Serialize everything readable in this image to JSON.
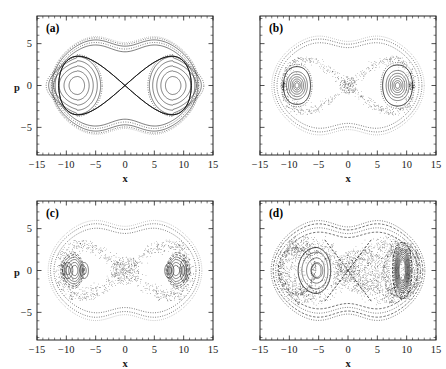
{
  "figure": {
    "panel_count": 4,
    "layout": "2x2 grid",
    "background_color": "#ffffff",
    "line_color": "#111111"
  },
  "axes": {
    "xlabel": "x",
    "ylabel": "p",
    "x_ticks": [
      "-15",
      "-10",
      "-5",
      "0",
      "5",
      "10",
      "15"
    ],
    "y_ticks": [
      "5",
      "0",
      "-5"
    ],
    "x_tick_values": [
      -15,
      -10,
      -5,
      0,
      5,
      10,
      15
    ],
    "y_tick_values": [
      5,
      0,
      -5
    ],
    "xlim": [
      -15,
      15
    ],
    "ylim": [
      -8.3,
      8.3
    ],
    "minor_tick_step": 1,
    "grid": false
  },
  "panels": [
    {
      "tag": "(a)",
      "name": "panel-a",
      "description": "Regular integrable phase portrait: two symmetric elliptic islands about x = -8 and x = +8 separated by a hyperbolic X-point at the origin, with smooth nested KAM tori and a figure-eight separatrix.",
      "regime": "integrable / unperturbed",
      "fixed_points": {
        "elliptic": [
          [
            -8,
            0
          ],
          [
            8,
            0
          ]
        ],
        "hyperbolic": [
          [
            0,
            0
          ]
        ]
      },
      "chaos_level": 0.0
    },
    {
      "tag": "(b)",
      "name": "panel-b",
      "description": "Weak perturbation: nested tori remain but the separatrix has broken into a thin stochastic layer; small secondary islands appear around each elliptic centre.",
      "regime": "weakly perturbed",
      "fixed_points": {
        "elliptic": [
          [
            -8,
            0
          ],
          [
            8,
            0
          ]
        ],
        "hyperbolic": [
          [
            0,
            0
          ]
        ]
      },
      "chaos_level": 0.25
    },
    {
      "tag": "(c)",
      "name": "panel-c",
      "description": "Moderate perturbation: broadened stochastic separatrix layer, distorted crescent-shaped inner tori and visible period-2 secondary island chains inside each well.",
      "regime": "moderately perturbed",
      "fixed_points": {
        "elliptic": [
          [
            -9.6,
            0
          ],
          [
            7.6,
            0
          ]
        ],
        "hyperbolic": [
          [
            0,
            0
          ]
        ]
      },
      "chaos_level": 0.5
    },
    {
      "tag": "(d)",
      "name": "panel-d",
      "description": "Strong perturbation: a large connected chaotic sea fills the region around the X-point and the right well; only a small regular island survives in the left well and a tightly wound regular region near x = +9.",
      "regime": "strongly perturbed / largely chaotic",
      "fixed_points": {
        "elliptic": [
          [
            -5.2,
            0
          ],
          [
            9.2,
            0
          ]
        ],
        "hyperbolic": [
          [
            0,
            0
          ]
        ]
      },
      "chaos_level": 0.85
    }
  ],
  "chart_data": {
    "type": "scatter",
    "xlabel": "x",
    "ylabel": "p",
    "xlim": [
      -15,
      15
    ],
    "ylim": [
      -8.3,
      8.3
    ],
    "grid": false,
    "legend": "none",
    "subplots": [
      {
        "tag": "(a)",
        "xlabel": "x",
        "ylabel": "p",
        "xlim": [
          -15,
          15
        ],
        "ylim": [
          -8.3,
          8.3
        ],
        "series": [
          {
            "name": "left-island-tori",
            "kind": "closed-contours",
            "center": [
              -8.2,
              0
            ],
            "semi_axes_x": [
              1.6,
              2.5,
              3.4,
              4.2
            ],
            "semi_axes_y": [
              1.4,
              2.2,
              2.9,
              3.5
            ],
            "style": "solid"
          },
          {
            "name": "right-island-tori",
            "kind": "closed-contours",
            "center": [
              8.2,
              0
            ],
            "semi_axes_x": [
              1.6,
              2.5,
              3.4,
              4.2
            ],
            "semi_axes_y": [
              1.4,
              2.2,
              2.9,
              3.5
            ],
            "style": "solid"
          },
          {
            "name": "separatrix-figure-eight",
            "kind": "separatrix",
            "x_extent": [
              -11.6,
              11.6
            ],
            "p_extent": [
              -5.4,
              5.4
            ],
            "saddle": [
              0,
              0
            ],
            "style": "solid"
          },
          {
            "name": "outer-circulating-tori",
            "kind": "closed-contours",
            "count": 5,
            "p_max": [
              5.7,
              6.0,
              6.3,
              6.5,
              6.7
            ],
            "x_max": [
              11.9,
              12.1,
              12.3,
              12.5,
              12.6
            ],
            "style": "solid-and-dotted"
          }
        ]
      },
      {
        "tag": "(b)",
        "xlabel": "x",
        "ylabel": "p",
        "xlim": [
          -15,
          15
        ],
        "ylim": [
          -8.3,
          8.3
        ],
        "series": [
          {
            "name": "left-island-tori",
            "kind": "closed-contours",
            "center": [
              -8.6,
              0
            ],
            "semi_axes_x": [
              0.5,
              1.0,
              1.6,
              2.3,
              3.0
            ],
            "semi_axes_y": [
              0.45,
              0.9,
              1.4,
              2.0,
              2.6
            ],
            "style": "solid"
          },
          {
            "name": "right-island-tori",
            "kind": "closed-contours",
            "center": [
              8.4,
              0
            ],
            "semi_axes_x": [
              0.6,
              1.2,
              1.9,
              2.7,
              3.4
            ],
            "semi_axes_y": [
              0.5,
              1.1,
              1.7,
              2.4,
              3.0
            ],
            "style": "solid"
          },
          {
            "name": "stochastic-separatrix-layer",
            "kind": "scatter-cloud",
            "n_points": 900,
            "x_extent": [
              -11.5,
              11.5
            ],
            "p_extent": [
              -4.6,
              4.6
            ],
            "style": "dotted"
          },
          {
            "name": "outer-invariant-curves",
            "kind": "closed-contours",
            "count": 3,
            "p_max": [
              5.6,
              6.2,
              6.6
            ],
            "x_max": [
              12.0,
              12.6,
              13.0
            ],
            "style": "dotted"
          }
        ]
      },
      {
        "tag": "(c)",
        "xlabel": "x",
        "ylabel": "p",
        "xlim": [
          -15,
          15
        ],
        "ylim": [
          -8.3,
          8.3
        ],
        "series": [
          {
            "name": "left-core-island",
            "kind": "closed-contours",
            "center": [
              -9.7,
              0
            ],
            "semi_axes_x": [
              0.45,
              0.85
            ],
            "semi_axes_y": [
              0.5,
              0.95
            ],
            "style": "solid"
          },
          {
            "name": "left-secondary-island",
            "kind": "closed-contours",
            "center": [
              -7.0,
              0
            ],
            "semi_axes_x": [
              0.7
            ],
            "semi_axes_y": [
              0.9
            ],
            "style": "solid"
          },
          {
            "name": "left-crescent-tori",
            "kind": "closed-contours",
            "center": [
              -8.4,
              0
            ],
            "count": 4,
            "style": "solid"
          },
          {
            "name": "right-core-island",
            "kind": "closed-contours",
            "center": [
              7.6,
              0
            ],
            "semi_axes_x": [
              0.35,
              0.7
            ],
            "semi_axes_y": [
              0.4,
              0.8
            ],
            "style": "solid"
          },
          {
            "name": "right-secondary-island",
            "kind": "closed-contours",
            "center": [
              9.9,
              0
            ],
            "semi_axes_x": [
              0.55
            ],
            "semi_axes_y": [
              1.2
            ],
            "style": "solid"
          },
          {
            "name": "right-crescent-tori",
            "kind": "closed-contours",
            "center": [
              8.6,
              0
            ],
            "count": 4,
            "style": "solid"
          },
          {
            "name": "broad-stochastic-layer",
            "kind": "scatter-cloud",
            "n_points": 1200,
            "x_extent": [
              -11.8,
              11.8
            ],
            "p_extent": [
              -4.4,
              4.4
            ],
            "style": "dashed-dotted"
          },
          {
            "name": "outer-invariant-curves",
            "kind": "closed-contours",
            "count": 3,
            "p_max": [
              5.5,
              6.3,
              6.8
            ],
            "x_max": [
              12.0,
              12.7,
              13.1
            ],
            "style": "dotted"
          }
        ]
      },
      {
        "tag": "(d)",
        "xlabel": "x",
        "ylabel": "p",
        "xlim": [
          -15,
          15
        ],
        "ylim": [
          -8.3,
          8.3
        ],
        "series": [
          {
            "name": "left-regular-island",
            "kind": "closed-contours",
            "center": [
              -5.3,
              0
            ],
            "semi_axes_x": [
              0.9,
              1.9,
              3.0
            ],
            "semi_axes_y": [
              0.85,
              1.7,
              2.6
            ],
            "style": "solid"
          },
          {
            "name": "right-regular-island",
            "kind": "closed-contours",
            "center": [
              9.3,
              0
            ],
            "semi_axes_x": [
              0.4,
              0.8,
              1.2,
              1.6
            ],
            "semi_axes_y": [
              1.0,
              1.8,
              2.4,
              2.9
            ],
            "style": "solid"
          },
          {
            "name": "chaotic-sea",
            "kind": "scatter-cloud",
            "n_points": 2600,
            "x_extent": [
              -11.8,
              12.2
            ],
            "p_extent": [
              -4.5,
              4.5
            ],
            "style": "dense-dots"
          },
          {
            "name": "outer-invariant-curves",
            "kind": "closed-contours",
            "count": 4,
            "p_max": [
              5.4,
              6.0,
              6.5,
              6.9
            ],
            "x_max": [
              11.9,
              12.5,
              12.9,
              13.2
            ],
            "style": "dashed"
          }
        ]
      }
    ]
  }
}
